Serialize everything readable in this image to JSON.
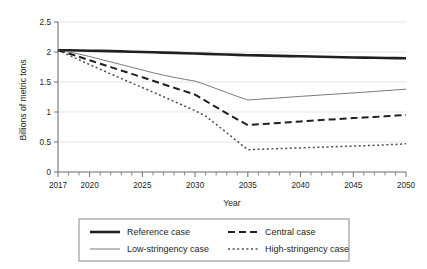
{
  "chart_data": {
    "type": "line",
    "title": "",
    "xlabel": "Year",
    "ylabel": "Billions of metric tons",
    "xlim": [
      2017,
      2050
    ],
    "ylim": [
      0,
      2.5
    ],
    "grid": true,
    "grid_axis": "y",
    "legend_position": "bottom",
    "x_tick_labels": [
      "2017",
      "2020",
      "2025",
      "2030",
      "2035",
      "2040",
      "2045",
      "2050"
    ],
    "x_tick_values": [
      2017,
      2020,
      2025,
      2030,
      2035,
      2040,
      2045,
      2050
    ],
    "x_minor_tick_step": 1,
    "y_tick_labels": [
      "0",
      "0.5",
      "1",
      "1.5",
      "2",
      "2.5"
    ],
    "y_tick_values": [
      0,
      0.5,
      1,
      1.5,
      2,
      2.5
    ],
    "x": [
      2017,
      2018,
      2019,
      2020,
      2021,
      2022,
      2023,
      2024,
      2025,
      2026,
      2027,
      2028,
      2029,
      2030,
      2031,
      2032,
      2033,
      2034,
      2035,
      2036,
      2037,
      2038,
      2039,
      2040,
      2041,
      2042,
      2043,
      2044,
      2045,
      2046,
      2047,
      2048,
      2049,
      2050
    ],
    "series": [
      {
        "name": "Reference case",
        "style": "solid-thick-black",
        "color": "#231f20",
        "width": 2.6,
        "dash": "",
        "values": [
          2.03,
          2.028,
          2.025,
          2.022,
          2.018,
          2.014,
          2.01,
          2.005,
          2.0,
          1.995,
          1.99,
          1.985,
          1.98,
          1.974,
          1.969,
          1.963,
          1.958,
          1.952,
          1.947,
          1.943,
          1.939,
          1.935,
          1.931,
          1.928,
          1.924,
          1.92,
          1.916,
          1.912,
          1.909,
          1.906,
          1.903,
          1.9,
          1.898,
          1.896
        ]
      },
      {
        "name": "Low-stringency case",
        "style": "solid-thin-gray",
        "color": "#7b7b7b",
        "width": 1.0,
        "dash": "",
        "values": [
          2.03,
          2.0,
          1.965,
          1.925,
          1.88,
          1.835,
          1.79,
          1.745,
          1.7,
          1.655,
          1.615,
          1.578,
          1.545,
          1.515,
          1.455,
          1.39,
          1.325,
          1.26,
          1.2,
          1.212,
          1.224,
          1.236,
          1.248,
          1.26,
          1.272,
          1.284,
          1.295,
          1.307,
          1.318,
          1.33,
          1.342,
          1.355,
          1.368,
          1.38
        ]
      },
      {
        "name": "Central case",
        "style": "dashed-black",
        "color": "#231f20",
        "width": 2.0,
        "dash": "7,4",
        "values": [
          2.03,
          1.975,
          1.92,
          1.862,
          1.805,
          1.748,
          1.692,
          1.635,
          1.578,
          1.52,
          1.462,
          1.405,
          1.348,
          1.29,
          1.185,
          1.08,
          0.978,
          0.878,
          0.782,
          0.794,
          0.806,
          0.818,
          0.83,
          0.842,
          0.854,
          0.866,
          0.877,
          0.888,
          0.898,
          0.908,
          0.918,
          0.928,
          0.94,
          0.952
        ]
      },
      {
        "name": "High-stringency case",
        "style": "dotted-gray",
        "color": "#4d4d4d",
        "width": 1.5,
        "dash": "2,2.6",
        "values": [
          2.03,
          1.95,
          1.87,
          1.79,
          1.712,
          1.635,
          1.558,
          1.482,
          1.408,
          1.332,
          1.255,
          1.178,
          1.1,
          1.022,
          0.93,
          0.795,
          0.655,
          0.512,
          0.372,
          0.378,
          0.384,
          0.39,
          0.396,
          0.402,
          0.408,
          0.414,
          0.42,
          0.426,
          0.432,
          0.438,
          0.444,
          0.452,
          0.46,
          0.47
        ]
      }
    ],
    "legend": [
      {
        "label": "Reference case"
      },
      {
        "label": "Central case"
      },
      {
        "label": "Low-stringency case"
      },
      {
        "label": "High-stringency case"
      }
    ]
  },
  "colors": {
    "axis": "#6d6e71",
    "grid": "#d9d9d9",
    "text": "#231f20",
    "black_series": "#231f20",
    "gray_series": "#7b7b7b",
    "legend_border": "#6d6e71",
    "background": "#ffffff"
  }
}
